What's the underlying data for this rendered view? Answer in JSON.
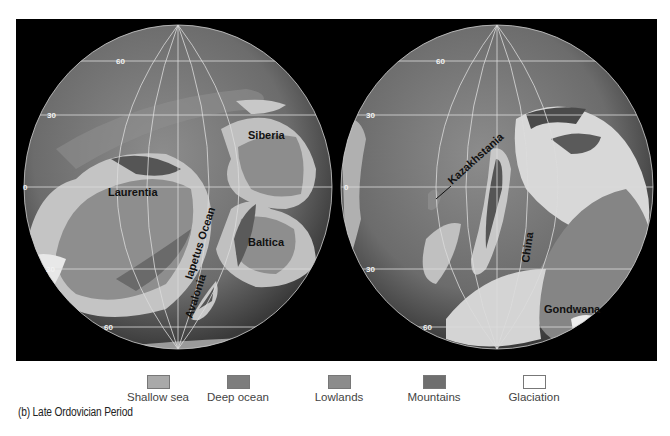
{
  "figure": {
    "caption": "(b) Late Ordovician Period",
    "globes": [
      {
        "id": "left",
        "latitude_labels": [
          "60",
          "30",
          "0",
          "30",
          "60"
        ],
        "landmasses": [
          "Siberia",
          "Laurentia",
          "Baltica",
          "Avalonia"
        ],
        "ocean_labels": [
          "Iapetus Ocean"
        ]
      },
      {
        "id": "right",
        "latitude_labels": [
          "60",
          "30",
          "0",
          "30",
          "60"
        ],
        "landmasses": [
          "Kazakhstania",
          "China",
          "Gondwana"
        ]
      }
    ]
  },
  "legend": {
    "items": [
      {
        "label": "Shallow sea",
        "color": "#a9a9a9",
        "icon": "shallow-sea-swatch"
      },
      {
        "label": "Deep ocean",
        "color": "#7d7d7d",
        "icon": "deep-ocean-swatch"
      },
      {
        "label": "Lowlands",
        "color": "#8c8c8c",
        "icon": "lowlands-swatch"
      },
      {
        "label": "Mountains",
        "color": "#6f6f6f",
        "icon": "mountains-swatch"
      },
      {
        "label": "Glaciation",
        "color": "#ffffff",
        "icon": "glaciation-swatch"
      }
    ]
  },
  "colors": {
    "frame": "#000000",
    "deep_ocean": "#6e6e6e",
    "shallow_sea": "#b4b4b4",
    "land": "#8a8a8a",
    "glacier": "#e6e6e6",
    "grid": "#dcdcdc"
  }
}
